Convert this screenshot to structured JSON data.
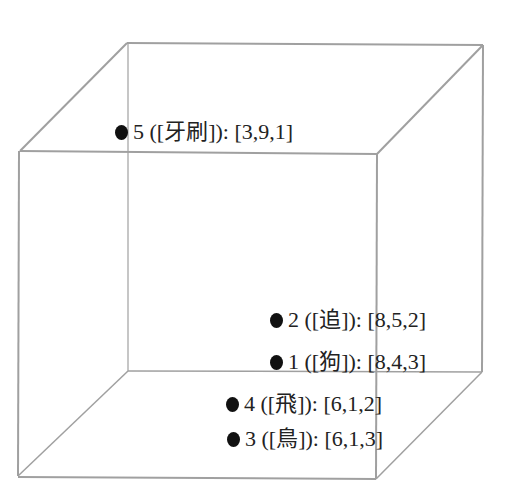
{
  "diagram": {
    "type": "3d-cube-word-vectors",
    "stroke_color": "#a0a0a0",
    "point_color": "#111111",
    "cube": {
      "back": {
        "tl": [
          127,
          43
        ],
        "tr": [
          483,
          45
        ],
        "bl": [
          128,
          371
        ],
        "br": [
          482,
          372
        ]
      },
      "front": {
        "tl": [
          20,
          151
        ],
        "tr": [
          377,
          154
        ],
        "bl": [
          18,
          476
        ],
        "br": [
          376,
          479
        ]
      }
    },
    "points": [
      {
        "id": "5",
        "word": "牙刷",
        "vector": "[3,9,1]",
        "text": "5 ([牙刷]): [3,9,1]",
        "x": 115,
        "y": 130
      },
      {
        "id": "2",
        "word": "追",
        "vector": "[8,5,2]",
        "text": "2 ([追]): [8,5,2]",
        "x": 270,
        "y": 318
      },
      {
        "id": "1",
        "word": "狗",
        "vector": "[8,4,3]",
        "text": "1 ([狗]): [8,4,3]",
        "x": 270,
        "y": 360
      },
      {
        "id": "4",
        "word": "飛",
        "vector": "[6,1,2]",
        "text": "4 ([飛]): [6,1,2]",
        "x": 226,
        "y": 402
      },
      {
        "id": "3",
        "word": "鳥",
        "vector": "[6,1,3]",
        "text": "3 ([鳥]): [6,1,3]",
        "x": 227,
        "y": 437
      }
    ]
  }
}
